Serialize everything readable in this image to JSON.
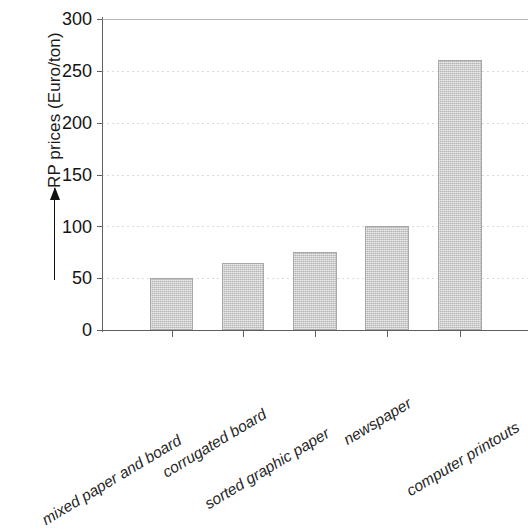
{
  "chart_data": {
    "type": "bar",
    "title": "",
    "subtitle": "",
    "xlabel": "",
    "ylabel": "RP prices (Euro/ton)",
    "ylabel_has_arrow": true,
    "categories": [
      "mixed paper and board",
      "corrugated board",
      "sorted graphic paper",
      "newspaper",
      "computer printouts"
    ],
    "values": [
      50,
      65,
      75,
      100,
      260
    ],
    "ylim": [
      0,
      300
    ],
    "yticks": [
      0,
      50,
      100,
      150,
      200,
      250,
      300
    ],
    "ytick_labels": [
      "0",
      "50",
      "100",
      "150",
      "200",
      "250",
      "300"
    ],
    "grid": true,
    "grid_axis": "y",
    "legend": "none",
    "series": [
      {
        "name": "RP prices",
        "values": [
          50,
          65,
          75,
          100,
          260
        ]
      }
    ],
    "colors": {
      "bar_fill": "#cccccc",
      "bar_border": "#a8a8a8",
      "axis": "#5f5f5f",
      "text": "#1a1a1a",
      "grid": "#9a9a9a",
      "background": "#ffffff"
    }
  }
}
